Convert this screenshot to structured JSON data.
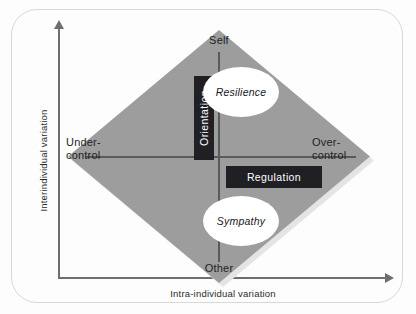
{
  "figure": {
    "type": "conceptual-diagram",
    "shape": "diamond",
    "axes": {
      "y_label": "Interindividual variation",
      "x_label": "Intra-individual variation",
      "y_arrow": "up-arrow-icon",
      "x_arrow": "right-arrow-icon"
    },
    "poles": {
      "top": "Self",
      "bottom": "Other",
      "left_line1": "Under-",
      "left_line2": "control",
      "right_line1": "Over-",
      "right_line2": "control"
    },
    "dimensions": [
      {
        "name": "Orientation",
        "orientation": "vertical"
      },
      {
        "name": "Regulation",
        "orientation": "horizontal"
      }
    ],
    "constructs": [
      {
        "name": "Resilience",
        "position": "upper"
      },
      {
        "name": "Sympathy",
        "position": "lower"
      }
    ],
    "colors": {
      "diamond_fill": "#9d9d9d",
      "diamond_shadow": "#e4e4e4",
      "box_fill": "#1f1f24",
      "box_text": "#ffffff",
      "ellipse_fill": "#ffffff",
      "axis_line": "#6e6e6e",
      "cross_line": "#5a5a5a",
      "frame_border": "#d8d8d8",
      "page_background": "#fdfdfd"
    }
  }
}
